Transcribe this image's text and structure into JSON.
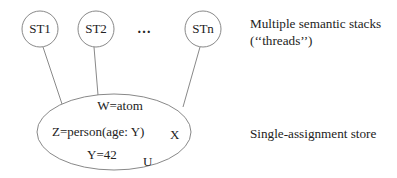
{
  "threads": [
    {
      "label": "ST1"
    },
    {
      "label": "ST2"
    },
    {
      "label": "STn"
    }
  ],
  "ellipsis": "…",
  "store": {
    "bindings": [
      "W=atom",
      "Z=person(age: Y)",
      "Y=42"
    ],
    "unbound": [
      "X",
      "U"
    ]
  },
  "annotations": {
    "threads_line1": "Multiple semantic stacks",
    "threads_line2": "(‘‘threads’’)",
    "store": "Single-assignment store"
  }
}
